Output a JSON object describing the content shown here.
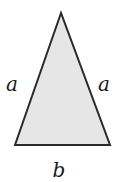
{
  "diagram": {
    "type": "isosceles-triangle",
    "fill": "#e6e6e6",
    "stroke": "#2a2a2a",
    "vertices": {
      "apex": [
        61,
        13
      ],
      "bottom_left": [
        15,
        145
      ],
      "bottom_right": [
        110,
        145
      ]
    },
    "labels": {
      "left_side": "a",
      "right_side": "a",
      "base": "b"
    }
  }
}
